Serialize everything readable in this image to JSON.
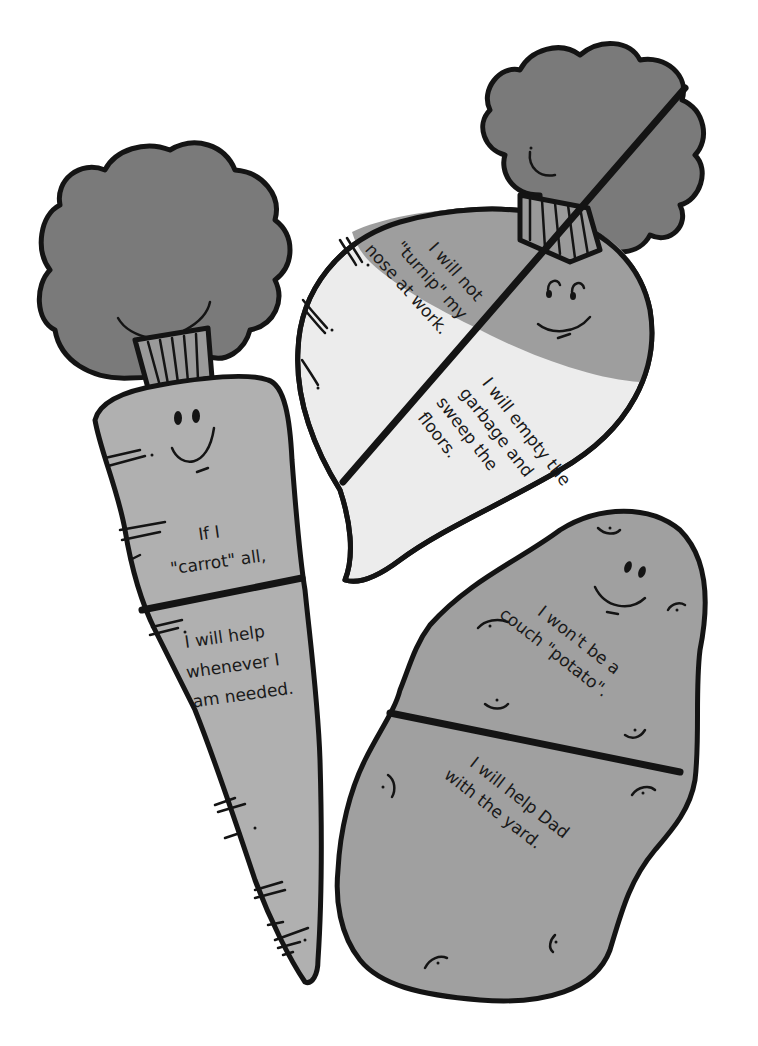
{
  "illustration": {
    "colors": {
      "outline": "#141414",
      "leaves": "#7a7a7a",
      "carrot_body": "#b0b0b0",
      "turnip_top": "#9e9e9e",
      "turnip_bottom": "#ececec",
      "potato": "#a0a0a0",
      "background": "#ffffff"
    },
    "carrot": {
      "top_text": [
        "If I",
        "\"carrot\" all,"
      ],
      "bottom_text": [
        "I will help",
        "whenever I",
        "am needed."
      ]
    },
    "turnip": {
      "top_text": [
        "I will not",
        "\"turnip\" my",
        "nose at work."
      ],
      "bottom_text": [
        "I will empty the",
        "garbage and",
        "sweep the",
        "floors."
      ]
    },
    "potato": {
      "top_text": [
        "I won't be a",
        "couch \"potato\"."
      ],
      "bottom_text": [
        "I will help Dad",
        "with the yard."
      ]
    }
  }
}
